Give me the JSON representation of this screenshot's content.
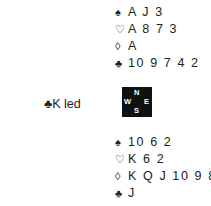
{
  "north": {
    "spades": {
      "symbol": "♠",
      "cards": "A J 3"
    },
    "hearts": {
      "symbol": "♡",
      "cards": "A 8 7 3"
    },
    "diamonds": {
      "symbol": "◊",
      "cards": "A"
    },
    "clubs": {
      "symbol": "♣",
      "cards": "10 9 7 4 2"
    }
  },
  "south": {
    "spades": {
      "symbol": "♠",
      "cards": "10 6 2"
    },
    "hearts": {
      "symbol": "♡",
      "cards": "K 6 2"
    },
    "diamonds": {
      "symbol": "◊",
      "cards": "K Q J 10 9 8"
    },
    "clubs": {
      "symbol": "♣",
      "cards": "J"
    }
  },
  "lead": {
    "text": "♣K led"
  },
  "compass": {
    "n": "N",
    "s": "S",
    "w": "W",
    "e": "E"
  }
}
